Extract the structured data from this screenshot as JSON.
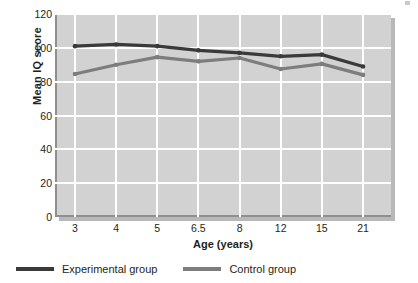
{
  "chart_data": {
    "type": "line",
    "title": "",
    "xlabel": "Age (years)",
    "ylabel": "Mean IQ score",
    "categories": [
      "3",
      "4",
      "5",
      "6.5",
      "8",
      "12",
      "15",
      "21"
    ],
    "ylim": [
      0,
      120
    ],
    "yticks": [
      0,
      20,
      40,
      60,
      80,
      100,
      120
    ],
    "grid": true,
    "legend_position": "bottom-left",
    "series": [
      {
        "name": "Experimental group",
        "color": "#3a3a3a",
        "values": [
          101,
          102,
          101,
          98.5,
          97,
          95,
          96,
          89
        ]
      },
      {
        "name": "Control group",
        "color": "#7d7d7d",
        "values": [
          84.5,
          90,
          94.5,
          92,
          94,
          87.5,
          90.5,
          84
        ]
      }
    ]
  },
  "axes": {
    "y_title": "Mean IQ score",
    "x_title": "Age (years)",
    "y_tick_labels": [
      "120",
      "100",
      "80",
      "60",
      "40",
      "20",
      "0"
    ],
    "x_tick_labels": [
      "3",
      "4",
      "5",
      "6.5",
      "8",
      "12",
      "15",
      "21"
    ]
  },
  "legend": {
    "items": [
      {
        "label": "Experimental group",
        "color": "#3a3a3a"
      },
      {
        "label": "Control group",
        "color": "#7d7d7d"
      }
    ]
  },
  "colors": {
    "plot_background": "#d2d2d2",
    "gridline": "#ffffff",
    "shadow": "#b8b8b8",
    "text": "#231f20",
    "experimental": "#3a3a3a",
    "control": "#7d7d7d"
  }
}
